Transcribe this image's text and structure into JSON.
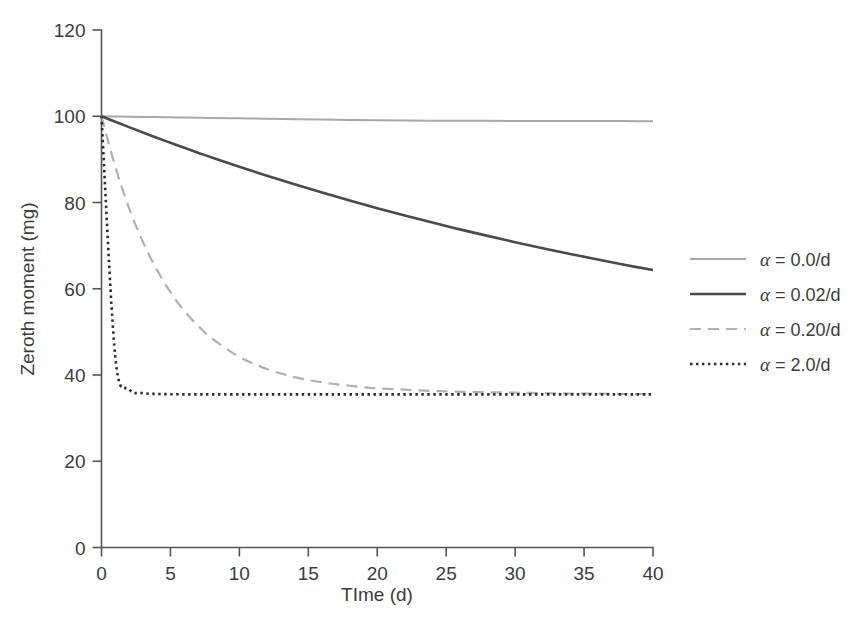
{
  "chart_data": {
    "type": "line",
    "title": "",
    "xlabel": "TIme (d)",
    "ylabel": "Zeroth moment (mg)",
    "xlim": [
      0,
      40
    ],
    "ylim": [
      0,
      120
    ],
    "xticks": [
      "0",
      "5",
      "10",
      "15",
      "20",
      "25",
      "30",
      "35",
      "40"
    ],
    "xtick_values": [
      0,
      5,
      10,
      15,
      20,
      25,
      30,
      35,
      40
    ],
    "yticks": [
      "0",
      "20",
      "40",
      "60",
      "80",
      "100",
      "120"
    ],
    "ytick_values": [
      0,
      20,
      40,
      60,
      80,
      100,
      120
    ],
    "grid": false,
    "legend_position": "right",
    "initial_value": 100,
    "asymptote": 35.5,
    "x": [
      0,
      1,
      2,
      3,
      4,
      5,
      6,
      7,
      8,
      10,
      12,
      14,
      16,
      18,
      20,
      22,
      24,
      26,
      28,
      30,
      32,
      34,
      36,
      38,
      40
    ],
    "series": [
      {
        "name": "alpha-0.0",
        "label": "α = 0.0/d",
        "alpha": 0.0,
        "color": "#a8a8a8",
        "style": "solid",
        "width": 2.0,
        "values": [
          100,
          99.95,
          99.9,
          99.85,
          99.8,
          99.76,
          99.71,
          99.66,
          99.61,
          99.52,
          99.43,
          99.33,
          99.24,
          99.14,
          99.05,
          99.0,
          98.97,
          98.95,
          98.93,
          98.91,
          98.9,
          98.89,
          98.88,
          98.87,
          98.86
        ]
      },
      {
        "name": "alpha-0.02",
        "label": "α = 0.02/d",
        "alpha": 0.02,
        "color": "#4a4a4a",
        "style": "solid",
        "width": 2.6,
        "values": [
          100,
          98.72,
          97.47,
          96.24,
          95.03,
          93.85,
          92.69,
          91.56,
          90.44,
          88.28,
          86.21,
          84.21,
          82.3,
          80.45,
          78.68,
          76.98,
          75.34,
          73.77,
          72.26,
          70.8,
          69.4,
          68.06,
          66.77,
          65.52,
          64.33
        ]
      },
      {
        "name": "alpha-0.20",
        "label": "α = 0.20/d",
        "alpha": 0.2,
        "color": "#b0b0b0",
        "style": "dashed",
        "width": 2.2,
        "values": [
          100,
          88.3,
          78.7,
          70.9,
          64.5,
          59.2,
          54.9,
          51.4,
          48.5,
          44.2,
          41.4,
          39.5,
          38.3,
          37.5,
          36.9,
          36.6,
          36.3,
          36.1,
          36.0,
          35.9,
          35.8,
          35.7,
          35.7,
          35.6,
          35.6
        ]
      },
      {
        "name": "alpha-2.0",
        "label": "α = 2.0/d",
        "alpha": 2.0,
        "color": "#2e2e2e",
        "style": "dotted",
        "width": 2.6,
        "values": [
          100,
          44.2,
          36.7,
          35.8,
          35.6,
          35.55,
          35.5,
          35.5,
          35.5,
          35.5,
          35.5,
          35.5,
          35.5,
          35.5,
          35.5,
          35.5,
          35.5,
          35.5,
          35.5,
          35.5,
          35.5,
          35.5,
          35.5,
          35.5,
          35.5
        ]
      }
    ]
  },
  "legend": {
    "entries": [
      {
        "label": "α = 0.0/d",
        "symbol": "α",
        "rest": " = 0.0/d"
      },
      {
        "label": "α = 0.02/d",
        "symbol": "α",
        "rest": " = 0.02/d"
      },
      {
        "label": "α = 0.20/d",
        "symbol": "α",
        "rest": " = 0.20/d"
      },
      {
        "label": "α = 2.0/d",
        "symbol": "α",
        "rest": " = 2.0/d"
      }
    ]
  }
}
